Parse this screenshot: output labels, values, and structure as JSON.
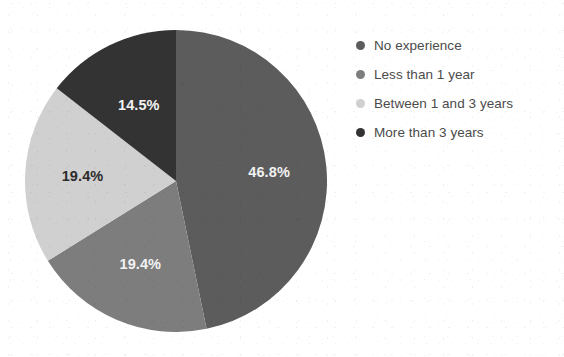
{
  "chart_data": {
    "type": "pie",
    "title": "",
    "labels": [
      "No experience",
      "Less than 1 year",
      "Between 1 and 3 years",
      "More than 3 years"
    ],
    "values": [
      46.8,
      19.4,
      19.4,
      14.5
    ],
    "value_labels": [
      "46.8%",
      "19.4%",
      "19.4%",
      "14.5%"
    ],
    "unit": "%",
    "colors": [
      "#5c5c5c",
      "#7d7d7d",
      "#d0d0d0",
      "#333333"
    ],
    "label_text_colors": [
      "#f2f2f2",
      "#f2f2f2",
      "#2b2b2b",
      "#f2f2f2"
    ],
    "start_angle_deg": 0,
    "direction": "clockwise",
    "legend_position": "right",
    "grid": false,
    "background": "#ffffff",
    "slices": [
      {
        "label": "No experience",
        "value": 46.8,
        "value_label": "46.8%",
        "color": "#5c5c5c",
        "label_color": "#f2f2f2"
      },
      {
        "label": "Less than 1 year",
        "value": 19.4,
        "value_label": "19.4%",
        "color": "#7d7d7d",
        "label_color": "#f2f2f2"
      },
      {
        "label": "Between 1 and 3 years",
        "value": 19.4,
        "value_label": "19.4%",
        "color": "#d0d0d0",
        "label_color": "#2b2b2b"
      },
      {
        "label": "More than 3 years",
        "value": 14.5,
        "value_label": "14.5%",
        "color": "#333333",
        "label_color": "#f2f2f2"
      }
    ]
  },
  "legend": {
    "items": [
      {
        "label": "No experience",
        "color": "#5c5c5c"
      },
      {
        "label": "Less than 1 year",
        "color": "#7d7d7d"
      },
      {
        "label": "Between 1 and 3 years",
        "color": "#d0d0d0"
      },
      {
        "label": "More than 3 years",
        "color": "#333333"
      }
    ]
  }
}
